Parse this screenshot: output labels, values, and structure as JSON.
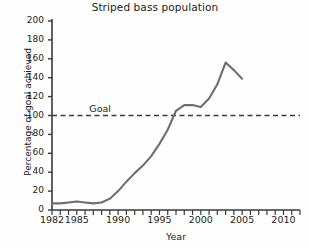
{
  "chart_data": {
    "type": "line",
    "title": "Striped bass population",
    "xlabel": "Year",
    "ylabel": "Percentage of goal achieved",
    "xlim": [
      1982,
      2012
    ],
    "ylim": [
      0,
      200
    ],
    "ytick_step": 20,
    "xtick_minor_step": 1,
    "grid": false,
    "legend": "none",
    "line_color": "#6e6e6e",
    "axis_color": "#3a3a3a",
    "yticks": [
      0,
      20,
      40,
      60,
      80,
      100,
      120,
      140,
      160,
      180,
      200
    ],
    "ytick_labels": [
      "0",
      "20",
      "40",
      "60",
      "80",
      "100",
      "120",
      "140",
      "160",
      "180",
      "200"
    ],
    "xticks": [
      1982,
      1985,
      1990,
      1995,
      2000,
      2005,
      2010
    ],
    "xtick_labels": [
      "1982",
      "1985",
      "1990",
      "1995",
      "2000",
      "2005",
      "2010"
    ],
    "annotations": [
      {
        "name": "goal-reference-line",
        "label": "Goal",
        "type": "hline",
        "value": 100,
        "style": "dashed",
        "color": "#3a3a3a",
        "label_x": 1987
      }
    ],
    "series": [
      {
        "name": "Striped bass population",
        "x": [
          1982,
          1983,
          1984,
          1985,
          1986,
          1987,
          1988,
          1989,
          1990,
          1991,
          1992,
          1993,
          1994,
          1995,
          1996,
          1997,
          1998,
          1999,
          2000,
          2001,
          2002,
          2003,
          2004,
          2005
        ],
        "values": [
          7,
          7,
          8,
          9,
          8,
          7,
          8,
          12,
          20,
          30,
          39,
          47,
          57,
          70,
          85,
          105,
          111,
          111,
          109,
          118,
          133,
          156,
          148,
          139
        ]
      }
    ]
  }
}
